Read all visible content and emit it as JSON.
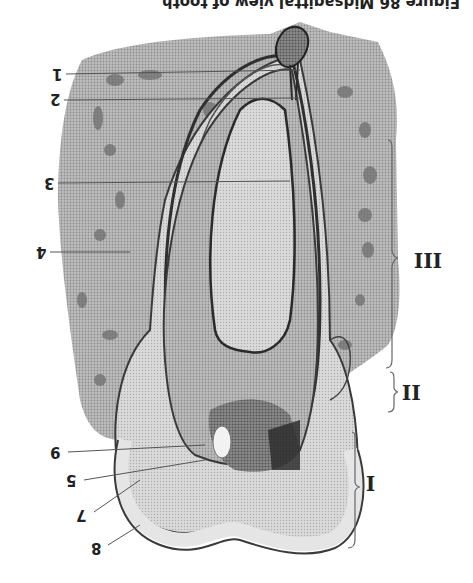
{
  "figure": {
    "orientation": "rotated-180",
    "caption": "Figure 86 Midsagittal view of tooth",
    "numbered_labels": [
      {
        "id": "1",
        "text": "1",
        "x": 52,
        "y": 66
      },
      {
        "id": "2",
        "text": "2",
        "x": 50,
        "y": 91
      },
      {
        "id": "3",
        "text": "3",
        "x": 44,
        "y": 175
      },
      {
        "id": "4",
        "text": "4",
        "x": 36,
        "y": 244
      },
      {
        "id": "9",
        "text": "9",
        "x": 50,
        "y": 444
      },
      {
        "id": "5",
        "text": "5",
        "x": 66,
        "y": 472
      },
      {
        "id": "7",
        "text": "7",
        "x": 76,
        "y": 507
      },
      {
        "id": "8",
        "text": "8",
        "x": 91,
        "y": 540
      }
    ],
    "region_labels": [
      {
        "id": "III",
        "text": "III",
        "x": 414,
        "y": 250
      },
      {
        "id": "II",
        "text": "II",
        "x": 400,
        "y": 382
      },
      {
        "id": "I",
        "text": "I",
        "x": 365,
        "y": 473
      }
    ],
    "colors": {
      "bone": "#a9a9a9",
      "tooth_light": "#cfcfcf",
      "dentin": "#9a9a9a",
      "pulp_dark": "#3a3a3a",
      "ink": "#2a2a2a",
      "paper": "#ffffff"
    }
  }
}
